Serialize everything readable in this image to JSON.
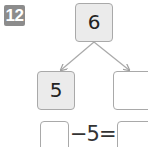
{
  "problem": {
    "number": "12",
    "badge_color": "#8c8c8c"
  },
  "number_bond": {
    "whole": "6",
    "part_left": "5",
    "part_right": ""
  },
  "equation": {
    "blank_left": "",
    "operator_text": "−5=",
    "blank_right": ""
  }
}
